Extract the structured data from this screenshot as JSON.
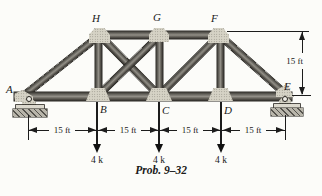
{
  "caption": "Prob. 9–32",
  "joints": {
    "A": "A",
    "B": "B",
    "C": "C",
    "D": "D",
    "E": "E",
    "F": "F",
    "G": "G",
    "H": "H"
  },
  "loads": {
    "b": "4 k",
    "c": "4 k",
    "d": "4 k"
  },
  "dims": {
    "s1": "15 ft",
    "s2": "15 ft",
    "s3": "15 ft",
    "s4": "15 ft",
    "h": "15 ft"
  },
  "supports": {
    "left": "pin",
    "right": "rocker"
  },
  "colors": {
    "ink": "#1a1a1a",
    "member_dark": "#34322d",
    "member_light": "#918e86",
    "gusset": "#d6d3c6",
    "paper": "#fcfcf9"
  }
}
